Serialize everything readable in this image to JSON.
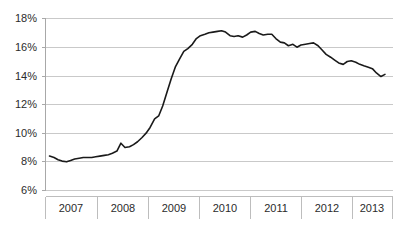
{
  "chart_data": {
    "type": "line",
    "title": "",
    "subtitle": "",
    "xlabel": "",
    "ylabel": "",
    "ylim": [
      6,
      18
    ],
    "ytick_values": [
      6,
      8,
      10,
      12,
      14,
      16,
      18
    ],
    "ytick_labels": [
      "6%",
      "8%",
      "10%",
      "12%",
      "14%",
      "16%",
      "18%"
    ],
    "xlim": [
      2006.5,
      2013.4
    ],
    "categories": [
      "2007",
      "2008",
      "2009",
      "2010",
      "2011",
      "2012",
      "2013"
    ],
    "xtick_labels": [
      "2007",
      "2008",
      "2009",
      "2010",
      "2011",
      "2012",
      "2013"
    ],
    "grid": "horizontal",
    "legend": "none",
    "series": [
      {
        "name": "rate",
        "color": "#1a1a1a",
        "x": [
          2006.58,
          2006.67,
          2006.75,
          2006.83,
          2006.92,
          2007.0,
          2007.08,
          2007.17,
          2007.25,
          2007.33,
          2007.42,
          2007.5,
          2007.58,
          2007.67,
          2007.75,
          2007.83,
          2007.92,
          2008.0,
          2008.08,
          2008.17,
          2008.25,
          2008.33,
          2008.42,
          2008.5,
          2008.58,
          2008.67,
          2008.75,
          2008.83,
          2008.92,
          2009.0,
          2009.08,
          2009.17,
          2009.25,
          2009.33,
          2009.42,
          2009.5,
          2009.58,
          2009.67,
          2009.75,
          2009.83,
          2009.92,
          2010.0,
          2010.08,
          2010.17,
          2010.25,
          2010.33,
          2010.42,
          2010.5,
          2010.58,
          2010.67,
          2010.75,
          2010.83,
          2010.92,
          2011.0,
          2011.08,
          2011.17,
          2011.25,
          2011.33,
          2011.42,
          2011.5,
          2011.58,
          2011.67,
          2011.75,
          2011.83,
          2011.92,
          2012.0,
          2012.08,
          2012.17,
          2012.25,
          2012.33,
          2012.42,
          2012.5,
          2012.58,
          2012.67,
          2012.75,
          2012.83,
          2012.92,
          2013.0,
          2013.08,
          2013.17,
          2013.25
        ],
        "values": [
          8.4,
          8.3,
          8.15,
          8.05,
          8.0,
          8.1,
          8.2,
          8.25,
          8.3,
          8.3,
          8.3,
          8.35,
          8.4,
          8.45,
          8.5,
          8.6,
          8.75,
          9.3,
          9.0,
          9.05,
          9.2,
          9.4,
          9.7,
          10.0,
          10.4,
          11.0,
          11.2,
          11.9,
          12.9,
          13.8,
          14.6,
          15.2,
          15.7,
          15.9,
          16.2,
          16.6,
          16.8,
          16.9,
          17.0,
          17.05,
          17.1,
          17.15,
          17.05,
          16.8,
          16.75,
          16.8,
          16.7,
          16.85,
          17.05,
          17.1,
          16.95,
          16.85,
          16.9,
          16.9,
          16.6,
          16.35,
          16.3,
          16.1,
          16.2,
          16.0,
          16.15,
          16.2,
          16.25,
          16.3,
          16.1,
          15.8,
          15.5,
          15.3,
          15.1,
          14.9,
          14.8,
          15.0,
          15.05,
          14.95,
          14.8,
          14.7,
          14.6,
          14.5,
          14.2,
          13.95,
          14.1
        ]
      }
    ]
  },
  "axes": {
    "y_tick_labels": [
      {
        "label": "18%",
        "value": 18
      },
      {
        "label": "16%",
        "value": 16
      },
      {
        "label": "14%",
        "value": 14
      },
      {
        "label": "12%",
        "value": 12
      },
      {
        "label": "10%",
        "value": 10
      },
      {
        "label": "8%",
        "value": 8
      },
      {
        "label": "6%",
        "value": 6
      }
    ],
    "x_band_labels": [
      "2007",
      "2008",
      "2009",
      "2010",
      "2011",
      "2012",
      "2013"
    ]
  }
}
